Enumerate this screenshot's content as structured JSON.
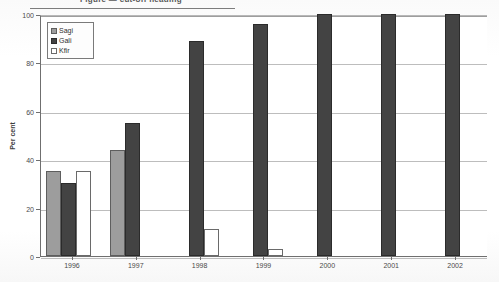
{
  "title": {
    "clipped_text": "Figure  —  cut-off heading"
  },
  "axis": {
    "y_title": "Per cent",
    "y_ticks": [
      "0",
      "20",
      "40",
      "60",
      "80",
      "100"
    ],
    "x_ticks": [
      "1996",
      "1997",
      "1998",
      "1999",
      "2000",
      "2001",
      "2002"
    ]
  },
  "legend": {
    "items": [
      {
        "label": "Sagi",
        "swatch": "gray-swatch-icon",
        "color": "#9d9d9d"
      },
      {
        "label": "Gali",
        "swatch": "dark-swatch-icon",
        "color": "#434343"
      },
      {
        "label": "Kfir",
        "swatch": "white-swatch-icon",
        "color": "#ffffff"
      }
    ]
  },
  "chart_data": {
    "type": "bar",
    "title": "",
    "xlabel": "",
    "ylabel": "Per cent",
    "ylim": [
      0,
      100
    ],
    "ytick_step": 20,
    "grid": true,
    "legend_position": "top-left-inside",
    "categories": [
      "1996",
      "1997",
      "1998",
      "1999",
      "2000",
      "2001",
      "2002"
    ],
    "series": [
      {
        "name": "Sagi",
        "color": "#9d9d9d",
        "values": [
          35,
          44,
          null,
          null,
          null,
          null,
          null
        ]
      },
      {
        "name": "Gali",
        "color": "#434343",
        "values": [
          30,
          55,
          89,
          96,
          100,
          100,
          100
        ]
      },
      {
        "name": "Kfir",
        "color": "#ffffff",
        "values": [
          35,
          null,
          11,
          3,
          null,
          null,
          null
        ]
      }
    ]
  }
}
